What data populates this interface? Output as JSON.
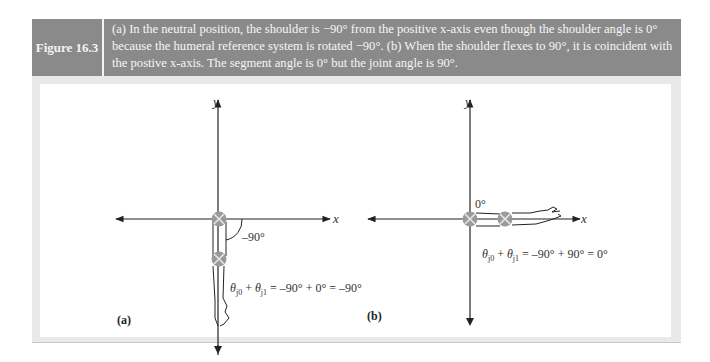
{
  "figure": {
    "label": "Figure 16.3",
    "caption": "(a) In the neutral position, the shoulder is −90° from the positive x-axis even though the shoulder angle is 0° because the humeral reference system is rotated −90°. (b) When the shoulder flexes to 90°, it is coincident with the postive x-axis. The segment angle is 0° but the joint angle is 90°."
  },
  "panel_a": {
    "label": "(a)",
    "y_axis": "y",
    "x_axis": "x",
    "angle_label": "–90°",
    "equation": "θ|0 + θ|1 = –90° + 0° = –90°"
  },
  "panel_b": {
    "label": "(b)",
    "y_axis": "y",
    "x_axis": "x",
    "angle_label": "0°",
    "equation": "θ|0 + θ|1 = –90° + 90° = 0°"
  },
  "colors": {
    "header_bg": "#8a8a8a",
    "panel_bg": "#e9e9e9",
    "joint": "#9a9a9a"
  }
}
